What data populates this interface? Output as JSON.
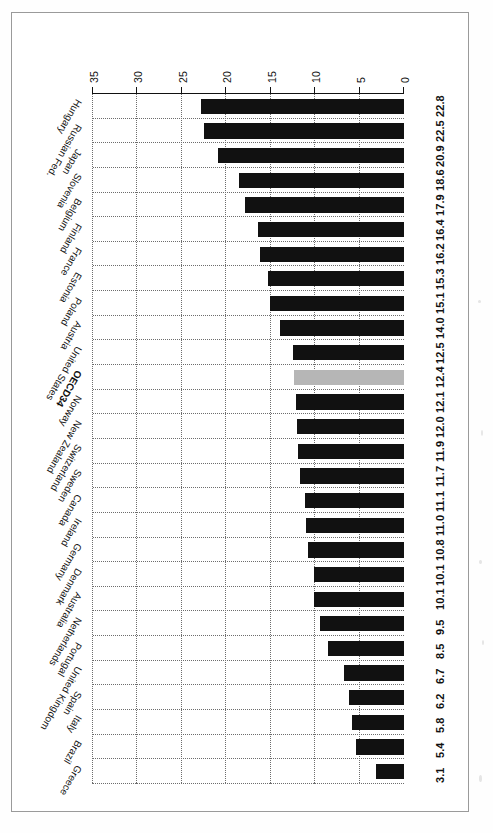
{
  "chart_data": {
    "type": "bar",
    "orientation": "horizontal",
    "title": "",
    "subtitle": "",
    "xlabel": "",
    "ylabel": "",
    "xlim": [
      0,
      35
    ],
    "xticks": [
      0,
      5,
      10,
      15,
      20,
      25,
      30,
      35
    ],
    "xtick_labels": [
      "0",
      "5",
      "10",
      "15",
      "20",
      "25",
      "30",
      "35"
    ],
    "grid": "both-dotted",
    "legend": "none",
    "highlight_category": "OECD34",
    "highlight_color": "#b6b6b6",
    "bar_color": "#111111",
    "page_rotation_degrees": 180,
    "categories": [
      "Greece",
      "Brazil",
      "Italy",
      "Spain",
      "United Kingdom",
      "Portugal",
      "Netherlands",
      "Australia",
      "Denmark",
      "Germany",
      "Ireland",
      "Canada",
      "Sweden",
      "Switzerland",
      "New Zealand",
      "Norway",
      "OECD34",
      "United States",
      "Austria",
      "Poland",
      "Estonia",
      "France",
      "Finland",
      "Belgium",
      "Slovenia",
      "Japan",
      "Russian Fed.",
      "Hungary"
    ],
    "values": [
      3.1,
      5.4,
      5.8,
      6.2,
      6.7,
      8.5,
      9.5,
      10.1,
      10.1,
      10.8,
      11.0,
      11.1,
      11.7,
      11.9,
      12.0,
      12.1,
      12.4,
      12.5,
      14.0,
      15.1,
      15.3,
      16.2,
      16.4,
      17.9,
      18.6,
      20.9,
      22.5,
      22.8
    ],
    "value_labels": [
      "3.1",
      "5.4",
      "5.8",
      "6.2",
      "6.7",
      "8.5",
      "9.5",
      "10.1",
      "10.1",
      "10.8",
      "11.0",
      "11.1",
      "11.7",
      "11.9",
      "12.0",
      "12.1",
      "12.4",
      "12.5",
      "14.0",
      "15.1",
      "15.3",
      "16.2",
      "16.4",
      "17.9",
      "18.6",
      "20.9",
      "22.5",
      "22.8"
    ]
  }
}
